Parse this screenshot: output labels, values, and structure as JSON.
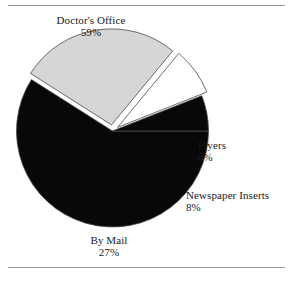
{
  "figure": {
    "name": "pie-chart-figure",
    "has_top_rule": true,
    "has_bottom_rule": true
  },
  "chart_data": {
    "type": "pie",
    "title": "",
    "xlabel": "",
    "ylabel": "",
    "legend_position": "none",
    "grid": false,
    "units": "percent",
    "categories": [
      "Doctor's Office",
      "By Mail",
      "Newspaper Inserts",
      "Flyers"
    ],
    "values": [
      59,
      27,
      8,
      6
    ],
    "slices": [
      {
        "label": "Doctor's Office",
        "value": 59,
        "percent_text": "59%",
        "color": "#080808",
        "start_angle": 0,
        "end_angle": 212.4
      },
      {
        "label": "By Mail",
        "value": 27,
        "percent_text": "27%",
        "color": "#d6d6d6",
        "start_angle": 212.4,
        "end_angle": 309.6
      },
      {
        "label": "Newspaper Inserts",
        "value": 8,
        "percent_text": "8%",
        "color": "#ffffff",
        "start_angle": 309.6,
        "end_angle": 338.4
      },
      {
        "label": "Flyers",
        "value": 6,
        "percent_text": "6%",
        "color": "#080808",
        "start_angle": 338.4,
        "end_angle": 360
      }
    ]
  },
  "labels": {
    "doctors_office": {
      "name": "Doctor's Office",
      "percent": "59%"
    },
    "by_mail": {
      "name": "By Mail",
      "percent": "27%"
    },
    "newspaper_inserts": {
      "name": "Newspaper Inserts",
      "percent": "8%"
    },
    "flyers": {
      "name": "Flyers",
      "percent": "6%"
    }
  },
  "colors": {
    "dark_slice": "#080808",
    "gray_slice": "#d6d6d6",
    "white_slice": "#ffffff",
    "outline": "#4a4a4a",
    "rule": "#9a9a9a",
    "text": "#1a1a1a",
    "background": "#ffffff"
  }
}
